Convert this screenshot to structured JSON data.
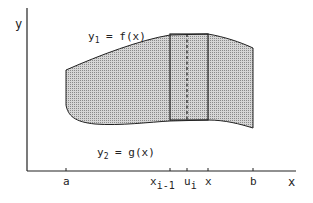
{
  "figure": {
    "type": "area-between-curves",
    "colors": {
      "ink": "#222222",
      "fill": "#bdbdbd",
      "background": "#ffffff"
    },
    "axes": {
      "y_label": "y",
      "x_label": "x"
    },
    "curves": {
      "upper_label_main": "y",
      "upper_label_sub": "1",
      "upper_label_rest": " = f(x)",
      "lower_label_main": "y",
      "lower_label_sub": "2",
      "lower_label_rest": " = g(x)"
    },
    "ticks": {
      "a": "a",
      "x_prev_main": "x",
      "x_prev_sub": "i-1",
      "u_main": "u",
      "u_sub": "i",
      "x_i": "x",
      "b": "b"
    }
  }
}
